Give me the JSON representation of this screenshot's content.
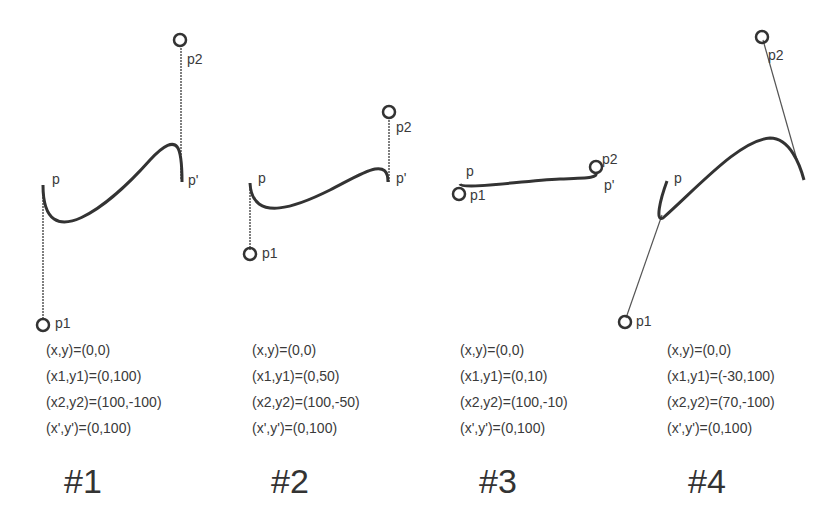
{
  "figures": [
    {
      "title": "#1",
      "formulas": [
        "(x,y)=(0,0)",
        "(x1,y1)=(0,100)",
        "(x2,y2)=(100,-100)",
        "(x',y')=(0,100)"
      ],
      "labels": {
        "p": "p",
        "p1": "p1",
        "p2": "p2",
        "pprime": "p'"
      }
    },
    {
      "title": "#2",
      "formulas": [
        "(x,y)=(0,0)",
        "(x1,y1)=(0,50)",
        "(x2,y2)=(100,-50)",
        "(x',y')=(0,100)"
      ],
      "labels": {
        "p": "p",
        "p1": "p1",
        "p2": "p2",
        "pprime": "p'"
      }
    },
    {
      "title": "#3",
      "formulas": [
        "(x,y)=(0,0)",
        "(x1,y1)=(0,10)",
        "(x2,y2)=(100,-10)",
        "(x',y')=(0,100)"
      ],
      "labels": {
        "p": "p",
        "p1": "p1",
        "p2": "p2",
        "pprime": "p'"
      }
    },
    {
      "title": "#4",
      "formulas": [
        "(x,y)=(0,0)",
        "(x1,y1)=(-30,100)",
        "(x2,y2)=(70,-100)",
        "(x',y')=(0,100)"
      ],
      "labels": {
        "p": "p",
        "p1": "p1",
        "p2": "p2",
        "pprime": ""
      }
    }
  ],
  "colors": {
    "curve": "#333333",
    "handle": "#555555",
    "text": "#3a3a3a"
  }
}
